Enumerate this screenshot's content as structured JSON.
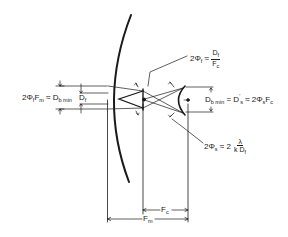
{
  "diagram": {
    "type": "optical-system-geometry",
    "colors": {
      "line": "#1a1a1a",
      "background": "#ffffff"
    },
    "labels": {
      "left_eq": {
        "lhs": "2Φ",
        "lhs_sub": "f",
        "lhs_var": "F",
        "lhs_var_sub": "m",
        "approx": " ≈ ",
        "rhs": "D",
        "rhs_sub": "b min",
        "df": "D",
        "df_sub": "f"
      },
      "top_eq": {
        "lhs": "2Φ",
        "lhs_sub": "f",
        "approx": " ≈ ",
        "num": "D",
        "num_sub": "f",
        "den": "F",
        "den_sub": "c"
      },
      "right_eq": {
        "lhs": "D",
        "lhs_sub": "b min",
        "eq": " = ",
        "mid": "D",
        "mid_sup": "′",
        "mid_sub": "s",
        "approx": " ≈ 2Φ",
        "rhs_sub": "s",
        "rhs": "F",
        "rhs_var_sub": "c"
      },
      "bottom_eq": {
        "lhs": "2Φ",
        "lhs_sub": "s",
        "approx": " ≈ 2 ",
        "num": "λ",
        "den": "k D",
        "den_sub": "f"
      },
      "fc": {
        "text": "F",
        "sub": "c"
      },
      "fm": {
        "text": "F",
        "sub": "m"
      }
    }
  }
}
